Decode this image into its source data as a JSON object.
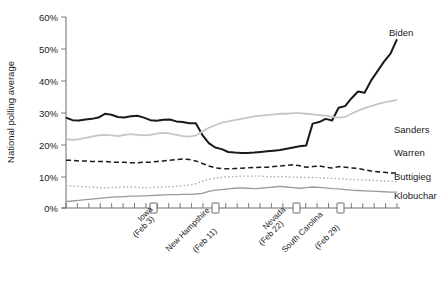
{
  "chart_data": {
    "type": "line",
    "title": "",
    "xlabel": "",
    "ylabel": "National polling average",
    "ylim": [
      0,
      60
    ],
    "ytick_labels": [
      "0%",
      "10%",
      "20%",
      "30%",
      "40%",
      "50%",
      "60%"
    ],
    "ytick_values": [
      0,
      10,
      20,
      30,
      40,
      50,
      60
    ],
    "grid": false,
    "legend_position": "right-inline",
    "xlim": [
      0,
      29
    ],
    "x_axis_note": "time axis, minor ticks evenly spaced; labelled primary-election events marked with square boxes",
    "annotations": [
      {
        "label": "Iowa",
        "sublabel": "(Feb 3)",
        "x": 8
      },
      {
        "label": "New Hampshire",
        "sublabel": "(Feb 11)",
        "x": 13
      },
      {
        "label": "Nevada",
        "sublabel": "(Feb 22)",
        "x": 19.5
      },
      {
        "label": "South Carolina",
        "sublabel": "(Feb 29)",
        "x": 23
      }
    ],
    "series": [
      {
        "name": "Biden",
        "color": "#1a1a1a",
        "width": 2.0,
        "dash": "none",
        "values": [
          28.4,
          27.6,
          27.5,
          27.8,
          28.0,
          28.4,
          29.6,
          29.3,
          28.6,
          28.4,
          28.8,
          29.0,
          28.4,
          27.6,
          27.4,
          27.7,
          27.8,
          27.2,
          27.0,
          26.6,
          26.6,
          23.0,
          20.4,
          19.0,
          18.5,
          17.6,
          17.4,
          17.3,
          17.3,
          17.4,
          17.6,
          17.8,
          18.0,
          18.2,
          18.6,
          19.0,
          19.4,
          19.6,
          26.5,
          27.0,
          28.0,
          27.5,
          31.5,
          32.0,
          34.5,
          36.6,
          36.2,
          40.0,
          43.0,
          46.0,
          48.5,
          53.0
        ]
      },
      {
        "name": "Sanders",
        "color": "#c6c6c6",
        "width": 1.8,
        "dash": "none",
        "values": [
          21.6,
          21.4,
          21.6,
          22.0,
          22.4,
          22.8,
          23.0,
          22.8,
          22.6,
          23.0,
          23.2,
          23.0,
          22.8,
          23.0,
          23.4,
          23.6,
          23.4,
          23.0,
          22.6,
          22.4,
          22.8,
          24.0,
          25.2,
          26.0,
          26.8,
          27.2,
          27.6,
          28.0,
          28.4,
          28.8,
          29.0,
          29.2,
          29.4,
          29.6,
          29.6,
          29.8,
          29.8,
          29.6,
          29.4,
          29.2,
          29.0,
          28.6,
          28.4,
          28.6,
          29.6,
          30.6,
          31.4,
          32.0,
          32.6,
          33.2,
          33.6,
          34.0
        ]
      },
      {
        "name": "Warren",
        "color": "#1a1a1a",
        "width": 1.5,
        "dash": "5,3",
        "values": [
          15.0,
          15.0,
          14.8,
          14.8,
          14.6,
          14.6,
          14.6,
          14.4,
          14.4,
          14.4,
          14.2,
          14.2,
          14.4,
          14.4,
          14.6,
          14.8,
          15.0,
          15.2,
          15.4,
          15.2,
          14.8,
          14.0,
          13.2,
          12.6,
          12.4,
          12.3,
          12.4,
          12.5,
          12.6,
          12.7,
          12.8,
          12.8,
          13.0,
          13.2,
          13.4,
          13.6,
          13.3,
          12.8,
          13.0,
          13.2,
          12.8,
          12.6,
          13.0,
          12.8,
          12.6,
          12.4,
          12.0,
          11.6,
          11.4,
          11.2,
          11.0,
          11.0
        ]
      },
      {
        "name": "Buttigieg",
        "color": "#b0b0b0",
        "width": 1.4,
        "dash": "1.6,2.2",
        "values": [
          7.0,
          6.9,
          6.8,
          6.7,
          6.6,
          6.4,
          6.3,
          6.4,
          6.5,
          6.6,
          6.6,
          6.5,
          6.4,
          6.4,
          6.5,
          6.6,
          6.7,
          6.8,
          7.0,
          7.2,
          7.6,
          8.4,
          9.0,
          9.4,
          9.6,
          9.8,
          9.9,
          10.0,
          10.0,
          10.0,
          10.0,
          9.9,
          9.8,
          9.8,
          9.8,
          9.7,
          9.6,
          9.6,
          9.6,
          9.5,
          9.4,
          9.3,
          9.2,
          9.1,
          9.0,
          8.9,
          8.8,
          8.7,
          8.6,
          8.5,
          8.4,
          8.3
        ]
      },
      {
        "name": "Klobuchar",
        "color": "#9a9a9a",
        "width": 1.3,
        "dash": "none",
        "values": [
          2.0,
          2.2,
          2.4,
          2.6,
          2.8,
          3.0,
          3.2,
          3.4,
          3.5,
          3.6,
          3.7,
          3.7,
          3.8,
          3.9,
          4.0,
          4.1,
          4.2,
          4.2,
          4.3,
          4.3,
          4.4,
          4.6,
          5.2,
          5.6,
          5.8,
          6.0,
          6.2,
          6.3,
          6.2,
          6.1,
          6.2,
          6.4,
          6.6,
          6.8,
          6.6,
          6.4,
          6.2,
          6.4,
          6.6,
          6.5,
          6.3,
          6.1,
          6.0,
          5.8,
          5.6,
          5.5,
          5.4,
          5.3,
          5.2,
          5.1,
          5.0,
          5.0
        ]
      }
    ]
  },
  "labels": {
    "ylabel": "National polling average",
    "series_labels": {
      "biden": "Biden",
      "sanders": "Sanders",
      "warren": "Warren",
      "buttigieg": "Buttigieg",
      "klobuchar": "Klobuchar"
    },
    "events": {
      "iowa_name": "Iowa",
      "iowa_date": "(Feb 3)",
      "nh_name": "New Hampshire",
      "nh_date": "(Feb 11)",
      "nevada_name": "Nevada",
      "nevada_date": "(Feb 22)",
      "sc_name": "South Carolina",
      "sc_date": "(Feb 29)"
    },
    "yticks": {
      "t0": "0%",
      "t10": "10%",
      "t20": "20%",
      "t30": "30%",
      "t40": "40%",
      "t50": "50%",
      "t60": "60%"
    }
  }
}
